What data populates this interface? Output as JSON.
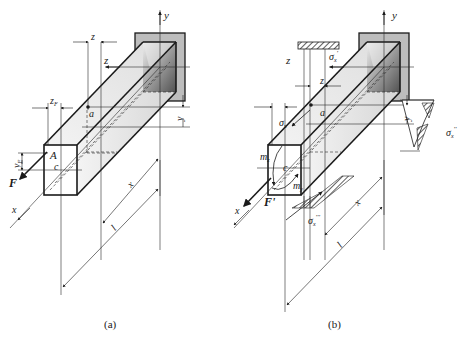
{
  "figure": {
    "panels": [
      {
        "id": "a",
        "caption": "(a)",
        "labels": {
          "y_axis": "y",
          "z_axis": "z",
          "x_axis": "x",
          "z_dim": "z",
          "zF": "z",
          "zF_sub": "F",
          "yF": "y",
          "yF_sub": "F",
          "y_dim": "y",
          "point_a": "a",
          "point_A": "A",
          "centroid": "c",
          "force": "F",
          "len_x": "x",
          "len_l": "l"
        }
      },
      {
        "id": "b",
        "caption": "(b)",
        "labels": {
          "y_axis": "y",
          "z_axis": "z",
          "x_axis": "x",
          "z_dim": "z",
          "y_dim": "y",
          "point_a": "a",
          "centroid": "c",
          "force": "F'",
          "sigma_x": "σ",
          "sigma_x_sub": "x",
          "sigma_x1": "σ",
          "sigma_x1_sub": "x",
          "sigma_x1_sup": "'",
          "sigma_x2": "σ",
          "sigma_x2_sub": "x",
          "sigma_x2_sup": "''",
          "sigma_x3": "σ",
          "sigma_x3_sub": "x",
          "sigma_x3_sup": "'''",
          "moment_z": "m",
          "moment_z_sub": "z",
          "moment_y": "m",
          "moment_y_sub": "y",
          "len_x": "x",
          "len_l": "l"
        }
      }
    ]
  }
}
